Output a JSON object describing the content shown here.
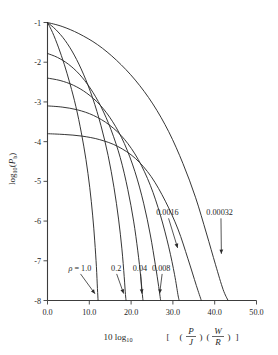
{
  "chart_data": {
    "type": "line",
    "title": "",
    "xlabel": "10 log10 [(P/J)(W/R)]",
    "ylabel": "log10(Pb)",
    "xlim": [
      0.0,
      50.0
    ],
    "ylim": [
      -8,
      -1
    ],
    "xticks": [
      "0.0",
      "10.0",
      "20.0",
      "30.0",
      "40.0",
      "50.0"
    ],
    "xtick_values": [
      0,
      10,
      20,
      30,
      40,
      50
    ],
    "yticks": [
      "-1",
      "-2",
      "-3",
      "-4",
      "-5",
      "-6",
      "-7",
      "-8"
    ],
    "ytick_values": [
      -1,
      -2,
      -3,
      -4,
      -5,
      -6,
      -7,
      -8
    ],
    "grid": false,
    "legend": "none",
    "series": [
      {
        "name": "1.0",
        "label": "ρ = 1.0",
        "points": [
          [
            0,
            -1.0
          ],
          [
            1.2,
            -1.25
          ],
          [
            2.6,
            -1.62
          ],
          [
            4.0,
            -2.05
          ],
          [
            5.4,
            -2.55
          ],
          [
            6.8,
            -3.12
          ],
          [
            8.1,
            -3.78
          ],
          [
            9.2,
            -4.45
          ],
          [
            10.1,
            -5.15
          ],
          [
            10.8,
            -5.85
          ],
          [
            11.3,
            -6.5
          ],
          [
            11.7,
            -7.15
          ],
          [
            11.95,
            -7.7
          ],
          [
            12.1,
            -8.0
          ]
        ]
      },
      {
        "name": "0.2",
        "label": "0.2",
        "points": [
          [
            0,
            -1.0
          ],
          [
            2.0,
            -1.18
          ],
          [
            4.2,
            -1.45
          ],
          [
            6.4,
            -1.82
          ],
          [
            8.6,
            -2.3
          ],
          [
            10.8,
            -2.9
          ],
          [
            12.8,
            -3.6
          ],
          [
            14.5,
            -4.35
          ],
          [
            15.9,
            -5.15
          ],
          [
            17.0,
            -5.95
          ],
          [
            17.8,
            -6.7
          ],
          [
            18.35,
            -7.4
          ],
          [
            18.65,
            -7.85
          ],
          [
            18.8,
            -8.0
          ]
        ]
      },
      {
        "name": "0.04",
        "label": "0.04",
        "points": [
          [
            0,
            -1.78
          ],
          [
            2.4,
            -1.88
          ],
          [
            5.0,
            -2.05
          ],
          [
            7.6,
            -2.3
          ],
          [
            10.2,
            -2.65
          ],
          [
            12.8,
            -3.12
          ],
          [
            15.2,
            -3.7
          ],
          [
            17.4,
            -4.4
          ],
          [
            19.2,
            -5.2
          ],
          [
            20.6,
            -6.0
          ],
          [
            21.6,
            -6.75
          ],
          [
            22.3,
            -7.4
          ],
          [
            22.7,
            -7.85
          ],
          [
            22.85,
            -8.0
          ]
        ]
      },
      {
        "name": "0.008",
        "label": "0.008",
        "points": [
          [
            0,
            -2.4
          ],
          [
            3.0,
            -2.46
          ],
          [
            6.2,
            -2.58
          ],
          [
            9.4,
            -2.78
          ],
          [
            12.6,
            -3.08
          ],
          [
            15.6,
            -3.5
          ],
          [
            18.4,
            -4.05
          ],
          [
            20.9,
            -4.75
          ],
          [
            23.0,
            -5.55
          ],
          [
            24.6,
            -6.35
          ],
          [
            25.8,
            -7.1
          ],
          [
            26.6,
            -7.65
          ],
          [
            27.0,
            -7.95
          ],
          [
            27.1,
            -8.0
          ]
        ]
      },
      {
        "name": "0.0016",
        "label": "0.0016",
        "points": [
          [
            0,
            -3.1
          ],
          [
            3.5,
            -3.13
          ],
          [
            7.2,
            -3.2
          ],
          [
            11.0,
            -3.34
          ],
          [
            14.8,
            -3.58
          ],
          [
            18.4,
            -3.94
          ],
          [
            21.7,
            -4.45
          ],
          [
            24.6,
            -5.1
          ],
          [
            27.0,
            -5.85
          ],
          [
            29.0,
            -6.65
          ],
          [
            30.4,
            -7.35
          ],
          [
            31.2,
            -7.85
          ],
          [
            31.5,
            -8.0
          ]
        ]
      },
      {
        "name": "0.00032-inner",
        "label": "",
        "points": [
          [
            0,
            -3.8
          ],
          [
            4.0,
            -3.82
          ],
          [
            8.2,
            -3.86
          ],
          [
            12.5,
            -3.95
          ],
          [
            16.8,
            -4.12
          ],
          [
            21.0,
            -4.42
          ],
          [
            24.8,
            -4.88
          ],
          [
            28.2,
            -5.5
          ],
          [
            31.2,
            -6.2
          ],
          [
            33.6,
            -6.95
          ],
          [
            35.6,
            -7.62
          ],
          [
            36.8,
            -8.0
          ]
        ]
      },
      {
        "name": "0.00032",
        "label": "0.00032",
        "points": [
          [
            0,
            -1.0
          ],
          [
            3.5,
            -1.1
          ],
          [
            7.5,
            -1.28
          ],
          [
            12.0,
            -1.56
          ],
          [
            16.5,
            -1.95
          ],
          [
            21.0,
            -2.45
          ],
          [
            25.2,
            -3.05
          ],
          [
            29.0,
            -3.75
          ],
          [
            32.4,
            -4.55
          ],
          [
            35.4,
            -5.4
          ],
          [
            38.0,
            -6.3
          ],
          [
            40.2,
            -7.1
          ],
          [
            42.0,
            -7.72
          ],
          [
            43.2,
            -8.0
          ]
        ]
      }
    ],
    "annotations": [
      {
        "text": "ρ = 1.0",
        "italic_prefix": true,
        "x": 5.0,
        "y": -7.25,
        "arrow_to": [
          11.5,
          -7.85
        ]
      },
      {
        "text": "0.2",
        "italic_prefix": false,
        "x": 15.2,
        "y": -7.25,
        "arrow_to": [
          18.3,
          -7.85
        ]
      },
      {
        "text": "0.04",
        "italic_prefix": false,
        "x": 20.4,
        "y": -7.25,
        "arrow_to": [
          22.6,
          -7.85
        ]
      },
      {
        "text": "0.008",
        "italic_prefix": false,
        "x": 25.0,
        "y": -7.25,
        "arrow_to": [
          26.8,
          -7.85
        ]
      },
      {
        "text": "0.0016",
        "italic_prefix": false,
        "x": 26.0,
        "y": -5.85,
        "arrow_to": [
          31.2,
          -6.7
        ]
      },
      {
        "text": "0.00032",
        "italic_prefix": false,
        "x": 38.0,
        "y": -5.85,
        "arrow_to": [
          41.6,
          -6.85
        ]
      }
    ]
  }
}
